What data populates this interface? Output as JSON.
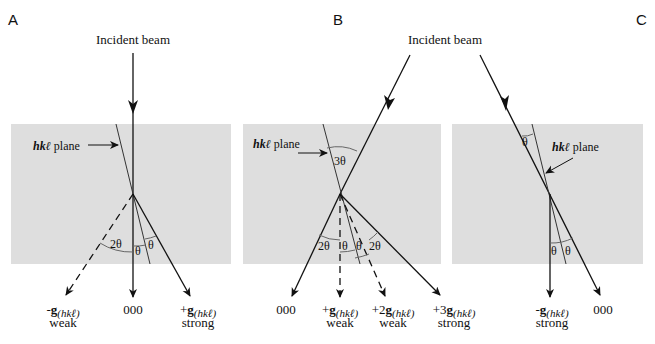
{
  "figure": {
    "type": "electron diffraction schematic (Bragg condition)",
    "colors": {
      "crystal_fill": "#dedede",
      "line": "#111111",
      "angle_arc": "#555555",
      "background": "#ffffff"
    },
    "panels": [
      {
        "id": "A",
        "label": "A",
        "incident_label": "Incident beam",
        "plane_label": "hkℓ plane",
        "angles": [
          "2θ",
          "θ",
          "θ"
        ],
        "beams": [
          {
            "prefix": "-",
            "symbol": "g",
            "sub": "(hkℓ)",
            "intensity": "weak",
            "style": "dashed"
          },
          {
            "prefix": "",
            "symbol": "000",
            "sub": "",
            "intensity": "",
            "style": "solid"
          },
          {
            "prefix": "+",
            "symbol": "g",
            "sub": "(hkℓ)",
            "intensity": "strong",
            "style": "solid"
          }
        ]
      },
      {
        "id": "B",
        "label": "B",
        "incident_label": "Incident beam",
        "plane_label": "hkℓ plane",
        "angles": [
          "3θ",
          "2θ",
          "θ",
          "θ",
          "2θ"
        ],
        "beams": [
          {
            "prefix": "",
            "symbol": "000",
            "sub": "",
            "intensity": "",
            "style": "solid"
          },
          {
            "prefix": "+",
            "symbol": "g",
            "sub": "(hkℓ)",
            "intensity": "weak",
            "style": "dashed"
          },
          {
            "prefix": "+2",
            "symbol": "g",
            "sub": "(hkℓ)",
            "intensity": "weak",
            "style": "dashed"
          },
          {
            "prefix": "+3",
            "symbol": "g",
            "sub": "(hkℓ)",
            "intensity": "strong",
            "style": "solid"
          }
        ]
      },
      {
        "id": "C",
        "label": "C",
        "plane_label": "hkℓ plane",
        "angles": [
          "θ",
          "θ",
          "θ"
        ],
        "beams": [
          {
            "prefix": "-",
            "symbol": "g",
            "sub": "(hkℓ)",
            "intensity": "strong",
            "style": "solid"
          },
          {
            "prefix": "",
            "symbol": "000",
            "sub": "",
            "intensity": "",
            "style": "solid"
          }
        ]
      }
    ]
  }
}
